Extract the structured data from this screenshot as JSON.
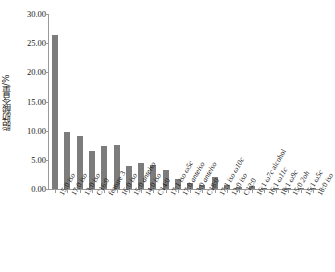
{
  "chart_data": {
    "type": "bar",
    "title": "",
    "xlabel": "",
    "ylabel": "脂肪酸含量/%",
    "ylim": [
      0,
      30
    ],
    "yticks": [
      0,
      5,
      10,
      15,
      20,
      25,
      30
    ],
    "ytick_labels": [
      "0.00",
      "5.00",
      "10.00",
      "15.00",
      "20.00",
      "25.00",
      "30.00"
    ],
    "grid": false,
    "legend": "none",
    "bar_color": "#7c7c7c",
    "axis_color": "#9a9a9a",
    "categories": [
      "15:0 iso",
      "17:0 iso",
      "13:0 iso",
      "C16:0",
      "feature 3",
      "16:0 iso",
      "15:0 anteiso",
      "14:0 iso",
      "C14:0",
      "17:1 iso ω5c",
      "17:0 anteiso",
      "13:0 anteiso",
      "C18:0",
      "17:1 iso ω10c",
      "12:0 iso",
      "C12:0",
      "16:1 ω7c alcohol",
      "16:1 ω11c",
      "18:1 ω9c",
      "15:0 2oh",
      "15:1 ω5c",
      "18:0 iso"
    ],
    "category_parts": [
      {
        "plain": "15:0 ",
        "italic": "iso"
      },
      {
        "plain": "17:0 ",
        "italic": "iso"
      },
      {
        "plain": "13:0 ",
        "italic": "iso"
      },
      {
        "plain": "C16:0",
        "italic": ""
      },
      {
        "plain": "feature 3",
        "italic": ""
      },
      {
        "plain": "16:0 ",
        "italic": "iso"
      },
      {
        "plain": "15:0 ",
        "italic": "anteiso"
      },
      {
        "plain": "14:0 ",
        "italic": "iso"
      },
      {
        "plain": "C14:0",
        "italic": ""
      },
      {
        "plain": "17:1 ",
        "italic": "iso ω5c"
      },
      {
        "plain": "17:0 ",
        "italic": "anteiso"
      },
      {
        "plain": "13:0 ",
        "italic": "anteiso"
      },
      {
        "plain": "C18:0",
        "italic": ""
      },
      {
        "plain": "17:1 ",
        "italic": "iso ω10c"
      },
      {
        "plain": "12:0 ",
        "italic": "iso"
      },
      {
        "plain": "C12:0",
        "italic": ""
      },
      {
        "plain": "16:1 ",
        "italic": "ω7c"
      },
      {
        "plain": "16:1 ",
        "italic": "ω11c"
      },
      {
        "plain": "18:1 ",
        "italic": "ω9c"
      },
      {
        "plain": "15:0 ",
        "italic": "2oh"
      },
      {
        "plain": "15:1 ",
        "italic": "ω5c"
      },
      {
        "plain": "18:0 ",
        "italic": "iso"
      }
    ],
    "category_suffix": [
      "",
      "",
      "",
      "",
      "",
      "",
      "",
      "",
      "",
      "",
      "",
      "",
      "",
      "",
      "",
      "",
      " alcohol",
      "",
      "",
      "",
      "",
      ""
    ],
    "values": [
      26.4,
      9.8,
      9.1,
      6.6,
      7.3,
      7.6,
      3.9,
      4.4,
      4.1,
      3.3,
      1.7,
      1.1,
      0.7,
      2.0,
      0.7,
      0.35,
      0.45,
      0.2,
      0.2,
      0.25,
      0.05,
      0.05
    ]
  }
}
